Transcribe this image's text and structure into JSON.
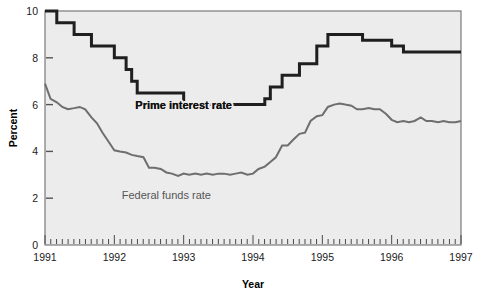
{
  "chart_data": {
    "type": "line",
    "title": "",
    "subtitle": "",
    "xlabel": "Year",
    "ylabel": "Percent",
    "xlim": [
      1991.0,
      1997.0
    ],
    "ylim": [
      0,
      10
    ],
    "y_ticks": [
      0,
      2,
      4,
      6,
      8,
      10
    ],
    "y_tick_labels": [
      "0",
      "2",
      "4",
      "6",
      "8",
      "10"
    ],
    "x_ticks": [
      1991,
      1992,
      1993,
      1994,
      1995,
      1996,
      1997
    ],
    "x_tick_labels": [
      "1991",
      "1992",
      "1993",
      "1994",
      "1995",
      "1996",
      "1997"
    ],
    "minor_x_ticks": "monthly",
    "grid": false,
    "legend_position": "inline-annotations",
    "plot_background": "#ececec",
    "series": [
      {
        "name": "Prime interest rate",
        "color": "#1f1f1f",
        "line_width": 3,
        "step": true,
        "annotation": "Prime interest rate",
        "annotation_x": 1993.0,
        "annotation_y": 6.0,
        "x": [
          1991.0,
          1991.08,
          1991.17,
          1991.25,
          1991.33,
          1991.42,
          1991.5,
          1991.58,
          1991.67,
          1991.75,
          1991.83,
          1991.92,
          1992.0,
          1992.08,
          1992.17,
          1992.25,
          1992.33,
          1992.42,
          1992.5,
          1992.58,
          1992.67,
          1992.75,
          1992.83,
          1992.92,
          1993.0,
          1993.5,
          1994.0,
          1994.17,
          1994.25,
          1994.33,
          1994.42,
          1994.58,
          1994.67,
          1994.75,
          1994.83,
          1994.92,
          1995.0,
          1995.08,
          1995.17,
          1995.25,
          1995.42,
          1995.58,
          1995.67,
          1995.83,
          1996.0,
          1996.08,
          1996.17,
          1996.33,
          1996.5,
          1996.75,
          1997.0
        ],
        "y": [
          10.0,
          10.0,
          9.5,
          9.5,
          9.5,
          9.0,
          9.0,
          9.0,
          8.5,
          8.5,
          8.5,
          8.5,
          8.0,
          8.0,
          7.5,
          7.0,
          6.5,
          6.5,
          6.5,
          6.5,
          6.5,
          6.5,
          6.5,
          6.5,
          6.0,
          6.0,
          6.0,
          6.25,
          6.75,
          6.75,
          7.25,
          7.25,
          7.75,
          7.75,
          7.75,
          8.5,
          8.5,
          9.0,
          9.0,
          9.0,
          9.0,
          8.75,
          8.75,
          8.75,
          8.5,
          8.5,
          8.25,
          8.25,
          8.25,
          8.25,
          8.25
        ]
      },
      {
        "name": "Federal funds rate",
        "color": "#6e6e6e",
        "line_width": 2,
        "step": false,
        "annotation": "Federal funds rate",
        "annotation_x": 1992.75,
        "annotation_y": 2.15,
        "x": [
          1991.0,
          1991.08,
          1991.17,
          1991.25,
          1991.33,
          1991.42,
          1991.5,
          1991.58,
          1991.67,
          1991.75,
          1991.83,
          1991.92,
          1992.0,
          1992.08,
          1992.17,
          1992.25,
          1992.33,
          1992.42,
          1992.5,
          1992.58,
          1992.67,
          1992.75,
          1992.83,
          1992.92,
          1993.0,
          1993.08,
          1993.17,
          1993.25,
          1993.33,
          1993.42,
          1993.5,
          1993.58,
          1993.67,
          1993.75,
          1993.83,
          1993.92,
          1994.0,
          1994.08,
          1994.17,
          1994.25,
          1994.33,
          1994.42,
          1994.5,
          1994.58,
          1994.67,
          1994.75,
          1994.83,
          1994.92,
          1995.0,
          1995.08,
          1995.17,
          1995.25,
          1995.33,
          1995.42,
          1995.5,
          1995.58,
          1995.67,
          1995.75,
          1995.83,
          1995.92,
          1996.0,
          1996.08,
          1996.17,
          1996.25,
          1996.33,
          1996.42,
          1996.5,
          1996.58,
          1996.67,
          1996.75,
          1996.83,
          1996.92,
          1997.0
        ],
        "y": [
          6.9,
          6.25,
          6.1,
          5.9,
          5.8,
          5.85,
          5.9,
          5.8,
          5.45,
          5.2,
          4.8,
          4.4,
          4.05,
          4.0,
          3.95,
          3.85,
          3.8,
          3.75,
          3.3,
          3.3,
          3.25,
          3.1,
          3.05,
          2.95,
          3.05,
          3.0,
          3.05,
          3.0,
          3.05,
          3.0,
          3.05,
          3.05,
          3.0,
          3.05,
          3.1,
          3.0,
          3.05,
          3.25,
          3.35,
          3.55,
          3.75,
          4.25,
          4.25,
          4.5,
          4.75,
          4.8,
          5.3,
          5.5,
          5.55,
          5.9,
          6.0,
          6.05,
          6.0,
          5.95,
          5.8,
          5.8,
          5.85,
          5.8,
          5.8,
          5.6,
          5.35,
          5.25,
          5.3,
          5.25,
          5.3,
          5.45,
          5.3,
          5.3,
          5.25,
          5.3,
          5.25,
          5.25,
          5.3
        ]
      }
    ]
  },
  "axis": {
    "y_label": "Percent",
    "x_label": "Year"
  }
}
